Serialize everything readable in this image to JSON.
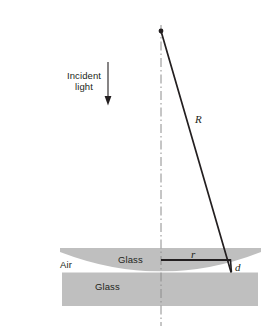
{
  "figure": {
    "background_color": "#ffffff",
    "glass_fill_color": "#bfbfbf",
    "line_color": "#231f20",
    "axis_color": "#8c8c8c",
    "width": 276,
    "height": 332
  },
  "labels": {
    "incident_light": "Incident\nlight",
    "air": "Air",
    "lens_glass": "Glass",
    "plate_glass": "Glass",
    "radius_R": "R",
    "radius_r": "r",
    "gap_d": "d"
  },
  "geometry": {
    "center_axis_x": 161,
    "apex_point": {
      "x": 161,
      "y": 31
    },
    "contact_point": {
      "x": 161,
      "y": 260
    },
    "ring_point": {
      "x": 230,
      "y": 258
    },
    "gap_bottom": {
      "x": 231,
      "y": 272
    },
    "R_line": {
      "x1": 161,
      "y1": 31,
      "x2": 231,
      "y2": 272
    },
    "r_line": {
      "x1": 161,
      "y1": 260,
      "x2": 230,
      "y2": 260
    },
    "incident_arrow": {
      "x": 108,
      "y1": 62,
      "y2": 104
    },
    "lens": {
      "left": 60,
      "right": 261,
      "top": 248,
      "bottom": 272
    },
    "plate": {
      "left": 62,
      "right": 258,
      "top": 272,
      "bottom": 306
    },
    "axis_span": {
      "y1": 25,
      "y2": 326
    }
  },
  "annotations": {
    "dash_pattern": "dash-dot",
    "arrow_direction": "down",
    "lens_curvature": "plano-convex, convex side down"
  }
}
